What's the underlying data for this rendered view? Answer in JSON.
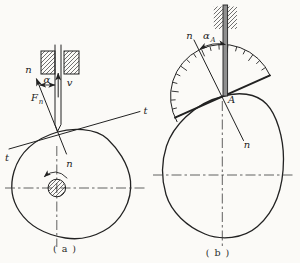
{
  "figure": {
    "panel_a": {
      "caption": "( a )",
      "labels": {
        "normal_top": "n",
        "pressure_angle": "α",
        "velocity": "v",
        "force_main": "F",
        "force_sub": "n",
        "tangent_right": "t",
        "tangent_left": "t",
        "normal_bottom": "n"
      }
    },
    "panel_b": {
      "caption": "( b )",
      "labels": {
        "normal_top": "n",
        "pressure_angle_main": "α",
        "pressure_angle_sub": "A",
        "contact_point": "A",
        "normal_bottom": "n"
      }
    },
    "colors": {
      "ink": "#222222",
      "rod_fill": "#8f8f8f",
      "background": "#fbfaf7"
    }
  }
}
